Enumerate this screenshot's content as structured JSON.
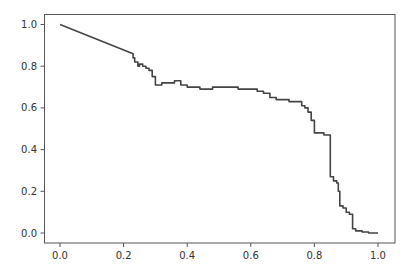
{
  "chart_data": {
    "type": "line",
    "title": "",
    "xlabel": "",
    "ylabel": "",
    "xlim": [
      -0.05,
      1.05
    ],
    "ylim": [
      -0.05,
      1.05
    ],
    "grid": false,
    "legend": null,
    "x_ticks": [
      "0.0",
      "0.2",
      "0.4",
      "0.6",
      "0.8",
      "1.0"
    ],
    "y_ticks": [
      "0.0",
      "0.2",
      "0.4",
      "0.6",
      "0.8",
      "1.0"
    ],
    "series": [
      {
        "name": "curve",
        "color": "#444444",
        "x": [
          0.0,
          0.23,
          0.235,
          0.245,
          0.25,
          0.26,
          0.27,
          0.28,
          0.29,
          0.3,
          0.305,
          0.32,
          0.34,
          0.36,
          0.38,
          0.4,
          0.42,
          0.44,
          0.46,
          0.48,
          0.5,
          0.52,
          0.54,
          0.56,
          0.58,
          0.6,
          0.62,
          0.64,
          0.66,
          0.68,
          0.7,
          0.72,
          0.74,
          0.76,
          0.77,
          0.78,
          0.79,
          0.8,
          0.81,
          0.83,
          0.85,
          0.855,
          0.86,
          0.87,
          0.875,
          0.88,
          0.89,
          0.9,
          0.91,
          0.92,
          0.93,
          0.95,
          0.97,
          1.0
        ],
        "y": [
          1.0,
          0.86,
          0.84,
          0.82,
          0.8,
          0.81,
          0.8,
          0.79,
          0.78,
          0.75,
          0.71,
          0.71,
          0.72,
          0.72,
          0.73,
          0.71,
          0.7,
          0.7,
          0.69,
          0.69,
          0.7,
          0.7,
          0.7,
          0.7,
          0.69,
          0.69,
          0.69,
          0.68,
          0.67,
          0.65,
          0.64,
          0.64,
          0.63,
          0.63,
          0.61,
          0.6,
          0.58,
          0.54,
          0.48,
          0.48,
          0.47,
          0.27,
          0.27,
          0.25,
          0.24,
          0.2,
          0.13,
          0.12,
          0.1,
          0.09,
          0.02,
          0.01,
          0.005,
          0.0
        ]
      }
    ]
  }
}
